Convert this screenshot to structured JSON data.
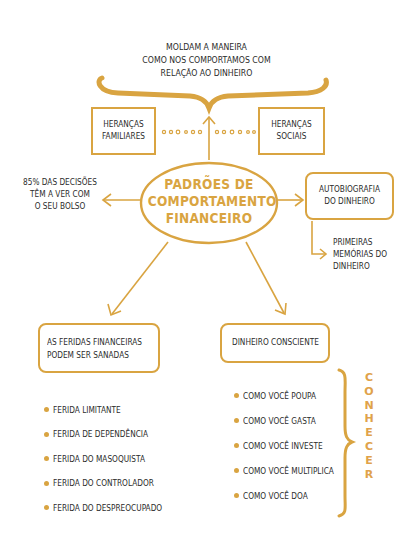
{
  "colors": {
    "accent": "#d9a441",
    "text": "#2b2b2b",
    "vertical_word": "#e0a24a",
    "background": "#ffffff"
  },
  "top_caption": {
    "line1": "MOLDAM A MANEIRA",
    "line2": "COMO NOS COMPORTAMOS COM",
    "line3": "RELAÇÃO AO DINHEIRO"
  },
  "heritage": {
    "left": {
      "line1": "HERANÇAS",
      "line2": "FAMILIARES"
    },
    "right": {
      "line1": "HERANÇAS",
      "line2": "SOCIAIS"
    }
  },
  "center_node": {
    "line1": "PADRÕES DE",
    "line2": "COMPORTAMENTO",
    "line3": "FINANCEIRO"
  },
  "left_note": {
    "line1": "85% DAS DECISÕES",
    "line2": "TÊM A VER COM",
    "line3": "O SEU BOLSO"
  },
  "autobiography": {
    "box": {
      "line1": "AUTOBIOGRAFIA",
      "line2": "DO DINHEIRO"
    },
    "sub": {
      "line1": "PRIMEIRAS",
      "line2": "MEMÓRIAS DO",
      "line3": "DINHEIRO"
    }
  },
  "wounds": {
    "box": {
      "line1": "AS FERIDAS FINANCEIRAS",
      "line2": "PODEM SER SANADAS"
    },
    "items": [
      "FERIDA LIMITANTE",
      "FERIDA DE DEPENDÊNCIA",
      "FERIDA DO MASOQUISTA",
      "FERIDA DO CONTROLADOR",
      "FERIDA DO DESPREOCUPADO"
    ]
  },
  "conscious": {
    "box": {
      "line1": "DINHEIRO CONSCIENTE"
    },
    "items": [
      "COMO VOCÊ POUPA",
      "COMO VOCÊ GASTA",
      "COMO VOCÊ INVESTE",
      "COMO VOCÊ MULTIPLICA",
      "COMO VOCÊ DOA"
    ],
    "vertical_word": [
      "C",
      "O",
      "N",
      "H",
      "E",
      "C",
      "E",
      "R"
    ]
  },
  "icons": [
    "curly-brace-icon",
    "arrow-up-icon",
    "dotted-connector-icon",
    "arrow-left-icon",
    "arrow-right-icon",
    "elbow-arrow-icon",
    "diagonal-arrow-icon",
    "bullet-dot-icon",
    "vertical-brace-icon"
  ]
}
